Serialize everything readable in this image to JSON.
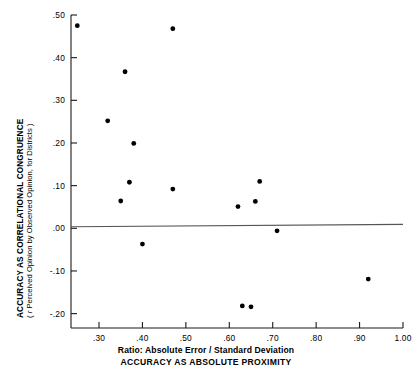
{
  "chart_data": {
    "type": "scatter",
    "title": "",
    "ylabel_main": "ACCURACY AS CORRELATIONAL CONGRUENCE",
    "ylabel_sub_pre": "( ",
    "ylabel_sub_r": "r",
    "ylabel_sub_post": " Perceived Opinion by Observed Opinion, for Districts )",
    "xlabel_line1": "Ratio: Absolute Error / Standard Deviation",
    "xlabel_line2": "ACCURACY AS ABSOLUTE PROXIMITY",
    "xlim": [
      0.2355,
      1.0
    ],
    "ylim": [
      -0.2337,
      0.5
    ],
    "grid": false,
    "legend": null,
    "xticks": [
      0.3,
      0.4,
      0.5,
      0.6,
      0.7,
      0.8,
      0.9,
      1.0
    ],
    "xtick_labels": [
      ".30",
      ".40",
      ".50",
      ".60",
      ".70",
      ".80",
      ".90",
      "1.00"
    ],
    "yticks": [
      0.5,
      0.4,
      0.3,
      0.2,
      0.1,
      0.0,
      -0.1,
      -0.2
    ],
    "ytick_labels": [
      ".50",
      ".40",
      ".30",
      ".20",
      ".10",
      ".00",
      "-.10",
      "-.20"
    ],
    "marker_color": "#000000",
    "axis_color": "#1a1a1a",
    "regression_line_color": "#555555",
    "regression_line": {
      "x0": 0.2355,
      "y0": 0.0035,
      "x1": 1.0,
      "y1": 0.0093
    },
    "points": [
      {
        "x": 0.25,
        "y": 0.475
      },
      {
        "x": 0.47,
        "y": 0.468
      },
      {
        "x": 0.36,
        "y": 0.367
      },
      {
        "x": 0.32,
        "y": 0.252
      },
      {
        "x": 0.38,
        "y": 0.199
      },
      {
        "x": 0.37,
        "y": 0.108
      },
      {
        "x": 0.35,
        "y": 0.064
      },
      {
        "x": 0.47,
        "y": 0.092
      },
      {
        "x": 0.67,
        "y": 0.11
      },
      {
        "x": 0.66,
        "y": 0.063
      },
      {
        "x": 0.62,
        "y": 0.051
      },
      {
        "x": 0.4,
        "y": -0.037
      },
      {
        "x": 0.71,
        "y": -0.006
      },
      {
        "x": 0.92,
        "y": -0.119
      },
      {
        "x": 0.63,
        "y": -0.182
      },
      {
        "x": 0.65,
        "y": -0.184
      }
    ]
  }
}
